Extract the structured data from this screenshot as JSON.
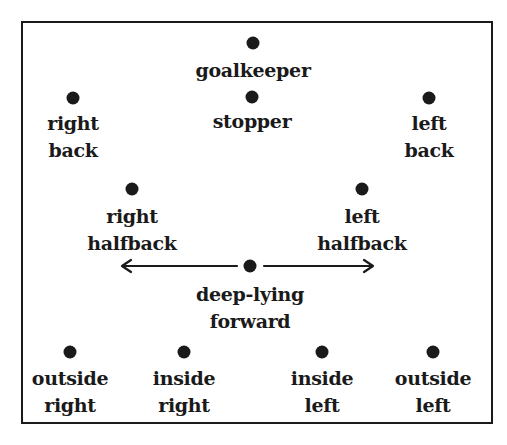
{
  "diagram": {
    "type": "soccer-formation",
    "positions": [
      {
        "id": "goalkeeper",
        "lines": [
          "goalkeeper"
        ],
        "dot": [
          253,
          43
        ],
        "label_top": 57
      },
      {
        "id": "stopper",
        "lines": [
          "stopper"
        ],
        "dot": [
          252,
          97
        ],
        "label_top": 108
      },
      {
        "id": "right-back",
        "lines": [
          "right",
          "back"
        ],
        "dot": [
          73,
          98
        ],
        "label_top": 110
      },
      {
        "id": "left-back",
        "lines": [
          "left",
          "back"
        ],
        "dot": [
          429,
          98
        ],
        "label_top": 110
      },
      {
        "id": "right-halfback",
        "lines": [
          "right",
          "halfback"
        ],
        "dot": [
          132,
          189
        ],
        "label_top": 203
      },
      {
        "id": "left-halfback",
        "lines": [
          "left",
          "halfback"
        ],
        "dot": [
          362,
          189
        ],
        "label_top": 203
      },
      {
        "id": "deep-lying-forward",
        "lines": [
          "deep-lying",
          "forward"
        ],
        "dot": [
          250,
          266
        ],
        "label_top": 281
      },
      {
        "id": "outside-right",
        "lines": [
          "outside",
          "right"
        ],
        "dot": [
          70,
          352
        ],
        "label_top": 365
      },
      {
        "id": "inside-right",
        "lines": [
          "inside",
          "right"
        ],
        "dot": [
          184,
          352
        ],
        "label_top": 365
      },
      {
        "id": "inside-left",
        "lines": [
          "inside",
          "left"
        ],
        "dot": [
          322,
          352
        ],
        "label_top": 365
      },
      {
        "id": "outside-left",
        "lines": [
          "outside",
          "left"
        ],
        "dot": [
          433,
          352
        ],
        "label_top": 365
      }
    ],
    "arrows": [
      {
        "from": "deep-lying-forward",
        "direction": "left",
        "x1": 237,
        "x2": 122,
        "y": 266
      },
      {
        "from": "deep-lying-forward",
        "direction": "right",
        "x1": 264,
        "x2": 373,
        "y": 266
      }
    ],
    "colors": {
      "ink": "#1a1a1a",
      "background": "#ffffff"
    }
  }
}
